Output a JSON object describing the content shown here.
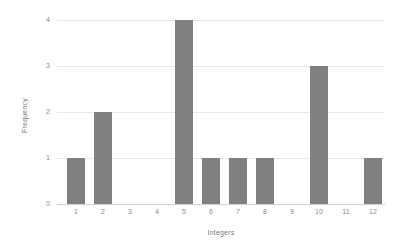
{
  "chart_data": {
    "type": "bar",
    "title": "",
    "xlabel": "Integers",
    "ylabel": "Frequency",
    "categories": [
      "1",
      "2",
      "3",
      "4",
      "5",
      "6",
      "7",
      "8",
      "9",
      "10",
      "11",
      "12"
    ],
    "values": [
      1,
      2,
      0,
      0,
      4,
      1,
      1,
      1,
      0,
      3,
      0,
      1
    ],
    "ylim": [
      0,
      4
    ],
    "yticks": [
      "0",
      "1",
      "2",
      "3",
      "4"
    ],
    "ytick_values": [
      0,
      1,
      2,
      3,
      4
    ],
    "grid": "horizontal",
    "legend": "none",
    "bar_color": "#808080",
    "gridline_color": "#e8e8e8",
    "axis_color": "#d0d0d0",
    "tick_label_color": "#8a8a8a",
    "axis_title_color": "#7a7a7a",
    "background_color": "#ffffff"
  }
}
